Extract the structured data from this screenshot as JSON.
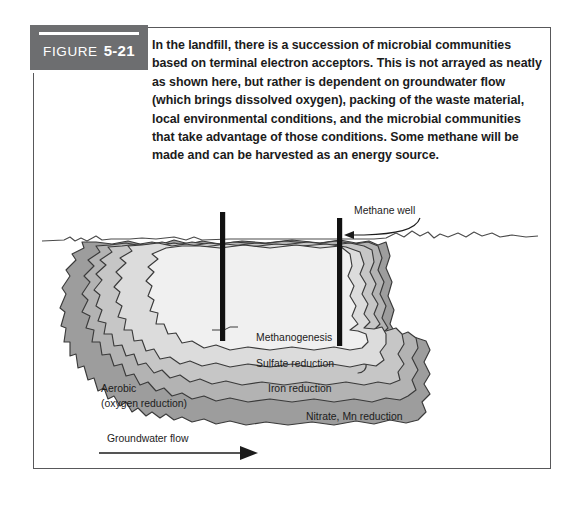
{
  "figure": {
    "tag_word": "FIGURE",
    "tag_number": "5-21",
    "caption": "In the landfill, there is a succession of microbial communities based on terminal electron acceptors. This is not arrayed as neatly as shown here, but rather is dependent on groundwater flow (which brings dissolved oxygen), packing of the waste material, local environmental conditions, and the microbial communities that take advantage of those conditions. Some methane will be made and can be harvested as an energy source."
  },
  "diagram": {
    "zone_labels": [
      {
        "id": "methanogenesis",
        "text": "Methanogenesis"
      },
      {
        "id": "sulfate-reduction",
        "text": "Sulfate reduction"
      },
      {
        "id": "iron-reduction",
        "text": "Iron reduction"
      },
      {
        "id": "nitrate-mn-reduction",
        "text": "Nitrate, Mn reduction"
      }
    ],
    "aerobic_label": {
      "line1": "Aerobic",
      "line2": "(oxygen reduction)"
    },
    "flow_label": "Groundwater flow",
    "well_callout": "Methane well",
    "wells": [
      {
        "id": "well-left"
      },
      {
        "id": "well-right"
      }
    ]
  },
  "colors": {
    "tag_background": "#6d6e70",
    "frame": "#58585a",
    "zone_core": "#f0f0f0",
    "zone_methanogenesis": "#dcdcdc",
    "zone_sulfate": "#c6c6c6",
    "zone_iron": "#b3b3b3",
    "zone_nitrate": "#9d9d9d",
    "outline": "#3a3a3a",
    "well": "#111111",
    "text": "#1c1c1c"
  }
}
